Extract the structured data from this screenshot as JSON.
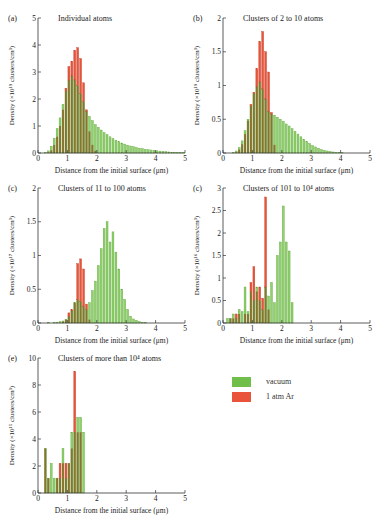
{
  "legend": {
    "items": [
      {
        "label": "vacuum",
        "color": "#6fbf4a"
      },
      {
        "label": "1 atm Ar",
        "color": "#e8533a"
      }
    ]
  },
  "chart_data": [
    {
      "id": "a",
      "type": "bar",
      "panel_label": "(a)",
      "title": "Individual atoms",
      "xlabel": "Distance from the initial surface (μm)",
      "ylabel": "Density (×10¹⁹ clusters/cm³)",
      "xlim": [
        0,
        5
      ],
      "ylim": [
        0,
        5
      ],
      "xticks": [
        0,
        1,
        2,
        3,
        4,
        5
      ],
      "yticks": [
        0,
        1,
        2,
        3,
        4,
        5
      ],
      "bin_width": 0.1,
      "x_start": 0.05,
      "series": [
        {
          "name": "vacuum",
          "values": [
            0,
            0,
            0.02,
            0.08,
            0.25,
            0.55,
            0.9,
            1.3,
            1.8,
            2.3,
            2.7,
            2.85,
            2.7,
            2.5,
            2.2,
            1.9,
            1.55,
            1.35,
            1.2,
            1.05,
            0.95,
            0.85,
            0.75,
            0.68,
            0.6,
            0.53,
            0.47,
            0.42,
            0.37,
            0.33,
            0.29,
            0.26,
            0.23,
            0.2,
            0.18,
            0.16,
            0.14,
            0.12,
            0.11,
            0.1,
            0.08,
            0.07,
            0.06,
            0.05,
            0.04,
            0.03,
            0.03,
            0.02,
            0.02,
            0.01
          ]
        },
        {
          "name": "1 atm Ar",
          "values": [
            0,
            0,
            0,
            0.02,
            0.1,
            0.3,
            0.6,
            1.0,
            1.6,
            2.4,
            3.2,
            3.4,
            3.8,
            3.9,
            3.5,
            2.6,
            1.6,
            0.8,
            0.3,
            0.08,
            0,
            0,
            0,
            0,
            0,
            0,
            0,
            0,
            0,
            0,
            0,
            0,
            0,
            0,
            0,
            0,
            0,
            0,
            0,
            0,
            0,
            0,
            0,
            0,
            0,
            0,
            0,
            0,
            0,
            0
          ]
        }
      ]
    },
    {
      "id": "b",
      "type": "bar",
      "panel_label": "(b)",
      "title": "Clusters of 2 to 10 atoms",
      "xlabel": "Distance from the initial surface (μm)",
      "ylabel": "Density (×10¹⁹ clusters/cm³)",
      "xlim": [
        0,
        5
      ],
      "ylim": [
        0,
        2
      ],
      "xticks": [
        0,
        1,
        2,
        3,
        4,
        5
      ],
      "yticks": [
        0,
        0.5,
        1,
        1.5,
        2
      ],
      "bin_width": 0.1,
      "x_start": 0.05,
      "series": [
        {
          "name": "vacuum",
          "values": [
            0,
            0,
            0,
            0.01,
            0.03,
            0.08,
            0.18,
            0.33,
            0.5,
            0.7,
            0.88,
            0.98,
            1.05,
            0.95,
            0.8,
            0.62,
            0.58,
            0.56,
            0.53,
            0.5,
            0.47,
            0.43,
            0.4,
            0.36,
            0.32,
            0.28,
            0.24,
            0.2,
            0.17,
            0.14,
            0.11,
            0.09,
            0.07,
            0.05,
            0.04,
            0.03,
            0.02,
            0.015,
            0.01,
            0.01,
            0.005,
            0,
            0,
            0,
            0,
            0,
            0,
            0,
            0,
            0
          ]
        },
        {
          "name": "1 atm Ar",
          "values": [
            0,
            0,
            0,
            0,
            0.01,
            0.05,
            0.13,
            0.28,
            0.48,
            0.72,
            0.9,
            1.25,
            1.65,
            1.8,
            1.5,
            1.2,
            0.6,
            0.12,
            0,
            0,
            0,
            0,
            0,
            0,
            0,
            0,
            0,
            0,
            0,
            0,
            0,
            0,
            0,
            0,
            0,
            0,
            0,
            0,
            0,
            0,
            0,
            0,
            0,
            0,
            0,
            0,
            0,
            0,
            0,
            0
          ]
        }
      ]
    },
    {
      "id": "c",
      "type": "bar",
      "panel_label": "(c)",
      "title": "Clusters of 11 to 100 atoms",
      "xlabel": "Distance from the initial surface (μm)",
      "ylabel": "Density (×10¹⁷ clusters/cm³)",
      "xlim": [
        0,
        5
      ],
      "ylim": [
        0,
        2
      ],
      "xticks": [
        0,
        1,
        2,
        3,
        4,
        5
      ],
      "yticks": [
        0,
        0.5,
        1,
        1.5,
        2
      ],
      "bin_width": 0.1,
      "x_start": 0.05,
      "series": [
        {
          "name": "vacuum",
          "values": [
            0,
            0,
            0,
            0.01,
            0,
            0.01,
            0.01,
            0.02,
            0.03,
            0.05,
            0.1,
            0.18,
            0.3,
            0.35,
            0.32,
            0.25,
            0.2,
            0.3,
            0.48,
            0.62,
            0.85,
            1.1,
            1.4,
            1.5,
            1.2,
            1.35,
            1.05,
            0.8,
            0.5,
            0.35,
            0.2,
            0.1,
            0.06,
            0.04,
            0.02,
            0.01,
            0.01,
            0,
            0,
            0,
            0,
            0,
            0,
            0,
            0,
            0,
            0,
            0,
            0,
            0
          ]
        },
        {
          "name": "1 atm Ar",
          "values": [
            0,
            0,
            0,
            0,
            0,
            0,
            0,
            0,
            0.02,
            0.05,
            0.15,
            0.2,
            0.3,
            0.88,
            0.95,
            0.8,
            0.28,
            0.05,
            0,
            0,
            0,
            0,
            0,
            0,
            0,
            0,
            0,
            0,
            0,
            0,
            0,
            0,
            0,
            0,
            0,
            0,
            0,
            0,
            0,
            0,
            0,
            0,
            0,
            0,
            0,
            0,
            0,
            0,
            0,
            0
          ]
        }
      ]
    },
    {
      "id": "d",
      "type": "bar",
      "panel_label": "(c)",
      "title": "Clusters of 101 to 10⁴ atoms",
      "xlabel": "Distance from the initial surface (μm)",
      "ylabel": "Density (×10¹⁶ clusters/cm³)",
      "xlim": [
        0,
        5
      ],
      "ylim": [
        0,
        3
      ],
      "xticks": [
        0,
        1,
        2,
        3,
        4,
        5
      ],
      "yticks": [
        0,
        0.5,
        1,
        1.5,
        2,
        2.5,
        3
      ],
      "bin_width": 0.1,
      "x_start": 0.05,
      "series": [
        {
          "name": "vacuum",
          "values": [
            0,
            0.1,
            0.1,
            0.2,
            0.1,
            0.3,
            0.25,
            0.8,
            0.25,
            0.7,
            0.5,
            0.8,
            0.5,
            0.3,
            0.8,
            0.6,
            0.9,
            0.45,
            1.5,
            1.8,
            2.6,
            1.8,
            1.6,
            0.45,
            0,
            0,
            0,
            0,
            0,
            0,
            0,
            0,
            0,
            0,
            0,
            0,
            0,
            0,
            0,
            0,
            0,
            0,
            0,
            0,
            0,
            0,
            0,
            0,
            0,
            0
          ]
        },
        {
          "name": "1 atm Ar",
          "values": [
            0,
            0,
            0.1,
            0.1,
            0.2,
            0.2,
            0,
            0.2,
            0.2,
            0.9,
            1.25,
            0.7,
            0.8,
            0.55,
            2.8,
            0.3,
            0,
            0,
            0,
            0,
            0,
            0,
            0,
            0,
            0,
            0,
            0,
            0,
            0,
            0,
            0,
            0,
            0,
            0,
            0,
            0,
            0,
            0,
            0,
            0,
            0,
            0,
            0,
            0,
            0,
            0,
            0,
            0,
            0,
            0
          ]
        }
      ]
    },
    {
      "id": "e",
      "type": "bar",
      "panel_label": "(e)",
      "title": "Clusters of more than 10⁴ atoms",
      "xlabel": "Distance from the initial surface (μm)",
      "ylabel": "Density (×10¹⁵ clusters/cm³)",
      "xlim": [
        0,
        5
      ],
      "ylim": [
        0,
        10
      ],
      "xticks": [
        0,
        1,
        2,
        3,
        4,
        5
      ],
      "yticks": [
        0,
        2,
        4,
        6,
        8,
        10
      ],
      "bin_width": 0.1,
      "x_start": 0.05,
      "series": [
        {
          "name": "vacuum",
          "values": [
            0,
            0,
            3.3,
            1.1,
            2.2,
            1.1,
            1.1,
            1.1,
            3.3,
            1.1,
            2.2,
            4.5,
            4.5,
            5.6,
            5.6,
            4.5,
            0,
            0,
            0,
            0,
            0,
            0,
            0,
            0,
            0,
            0,
            0,
            0,
            0,
            0,
            0,
            0,
            0,
            0,
            0,
            0,
            0,
            0,
            0,
            0,
            0,
            0,
            0,
            0,
            0,
            0,
            0,
            0,
            0,
            0
          ]
        },
        {
          "name": "1 atm Ar",
          "values": [
            0,
            0,
            3.3,
            1.1,
            0,
            0,
            1.1,
            2.2,
            2.2,
            2.2,
            2.2,
            3.3,
            9.0,
            4.5,
            4.5,
            0,
            0,
            0,
            0,
            0,
            0,
            0,
            0,
            0,
            0,
            0,
            0,
            0,
            0,
            0,
            0,
            0,
            0,
            0,
            0,
            0,
            0,
            0,
            0,
            0,
            0,
            0,
            0,
            0,
            0,
            0,
            0,
            0,
            0,
            0
          ]
        }
      ]
    }
  ]
}
